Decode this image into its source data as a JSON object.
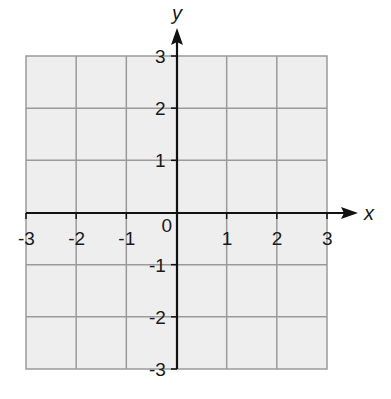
{
  "chart_data": {
    "type": "grid",
    "title": "",
    "xlabel": "x",
    "ylabel": "y",
    "xlim": [
      -3,
      3
    ],
    "ylim": [
      -3,
      3
    ],
    "grid": true,
    "x_ticks": [
      "-3",
      "-2",
      "-1",
      "0",
      "1",
      "2",
      "3"
    ],
    "y_ticks": [
      "3",
      "2",
      "1",
      "-1",
      "-2",
      "-3"
    ],
    "origin_label": "0",
    "series": []
  },
  "colors": {
    "grid_fill": "#eeeeee",
    "grid_line": "#9a9a9a",
    "axis": "#111111",
    "text": "#1a1a1a"
  }
}
